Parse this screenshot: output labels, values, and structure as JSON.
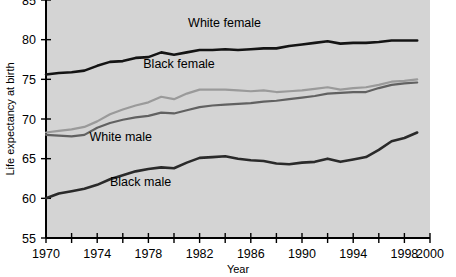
{
  "chart_data": {
    "type": "line",
    "title": "",
    "xlabel": "Year",
    "ylabel": "Life expectancy at birth",
    "xlim": [
      1970,
      2000
    ],
    "ylim": [
      55,
      85
    ],
    "ytick_values": [
      55,
      60,
      65,
      70,
      75,
      80,
      85
    ],
    "ytick_labels": [
      "55",
      "60",
      "65",
      "70",
      "75",
      "80",
      "85"
    ],
    "xtick_values": [
      1970,
      1972,
      1974,
      1976,
      1978,
      1980,
      1982,
      1984,
      1986,
      1988,
      1990,
      1992,
      1994,
      1996,
      1998,
      2000
    ],
    "xtick_labels_shown": [
      "1970",
      "1974",
      "1978",
      "1982",
      "1986",
      "1990",
      "1994",
      "1998",
      "2000"
    ],
    "xtick_labels_values": [
      1970,
      1974,
      1978,
      1982,
      1986,
      1990,
      1994,
      1998,
      2000
    ],
    "grid": false,
    "legend": "inline-labels",
    "plot_background": "#d4d4d4",
    "x": [
      1970,
      1971,
      1972,
      1973,
      1974,
      1975,
      1976,
      1977,
      1978,
      1979,
      1980,
      1981,
      1982,
      1983,
      1984,
      1985,
      1986,
      1987,
      1988,
      1989,
      1990,
      1991,
      1992,
      1993,
      1994,
      1995,
      1996,
      1997,
      1998,
      1999
    ],
    "series": [
      {
        "name": "White female",
        "color": "#141414",
        "width": 2.6,
        "label_x": 1981.1,
        "label_y": 81.6,
        "values": [
          75.6,
          75.8,
          75.9,
          76.1,
          76.7,
          77.2,
          77.3,
          77.7,
          77.8,
          78.4,
          78.1,
          78.4,
          78.7,
          78.7,
          78.8,
          78.7,
          78.8,
          78.9,
          78.9,
          79.2,
          79.4,
          79.6,
          79.8,
          79.5,
          79.6,
          79.6,
          79.7,
          79.9,
          79.9,
          79.9
        ]
      },
      {
        "name": "Black female",
        "color": "#9a9a9a",
        "width": 2.2,
        "label_x": 1977.6,
        "label_y": 76.4,
        "values": [
          68.3,
          68.5,
          68.7,
          69.0,
          69.7,
          70.6,
          71.2,
          71.7,
          72.1,
          72.8,
          72.5,
          73.2,
          73.7,
          73.7,
          73.7,
          73.6,
          73.5,
          73.6,
          73.4,
          73.5,
          73.6,
          73.8,
          74.0,
          73.7,
          73.9,
          74.0,
          74.3,
          74.7,
          74.8,
          75.0
        ]
      },
      {
        "name": "White male",
        "color": "#616161",
        "width": 2.2,
        "label_x": 1973.4,
        "label_y": 67.2,
        "values": [
          68.0,
          67.9,
          67.8,
          68.0,
          68.9,
          69.5,
          69.9,
          70.2,
          70.4,
          70.8,
          70.7,
          71.1,
          71.5,
          71.7,
          71.8,
          71.9,
          72.0,
          72.2,
          72.3,
          72.5,
          72.7,
          72.9,
          73.2,
          73.3,
          73.4,
          73.4,
          73.9,
          74.3,
          74.5,
          74.6
        ]
      },
      {
        "name": "Black male",
        "color": "#2a2a2a",
        "width": 2.6,
        "label_x": 1975.0,
        "label_y": 61.6,
        "values": [
          60.0,
          60.6,
          60.9,
          61.2,
          61.7,
          62.4,
          62.9,
          63.4,
          63.7,
          63.9,
          63.8,
          64.5,
          65.1,
          65.2,
          65.3,
          65.0,
          64.8,
          64.7,
          64.4,
          64.3,
          64.5,
          64.6,
          65.0,
          64.6,
          64.9,
          65.2,
          66.1,
          67.2,
          67.6,
          68.3
        ]
      }
    ]
  }
}
